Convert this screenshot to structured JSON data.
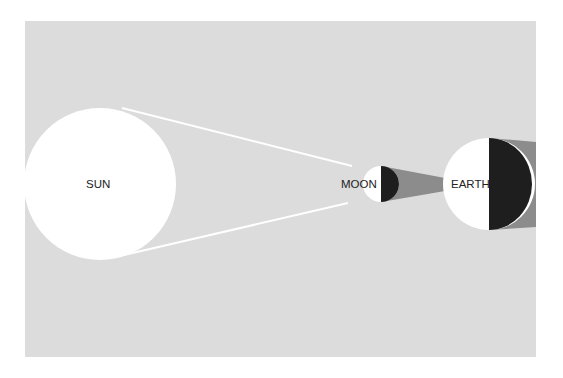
{
  "colors": {
    "background": "#ffffff",
    "panel": "#dcdcdc",
    "body": "#ffffff",
    "night_side": "#1e1e1e",
    "shadow": "#8c8c8c",
    "rays": "#ffffff"
  },
  "bodies": [
    {
      "id": "sun",
      "label": "SUN"
    },
    {
      "id": "moon",
      "label": "MOON"
    },
    {
      "id": "earth",
      "label": "EARTH"
    }
  ]
}
